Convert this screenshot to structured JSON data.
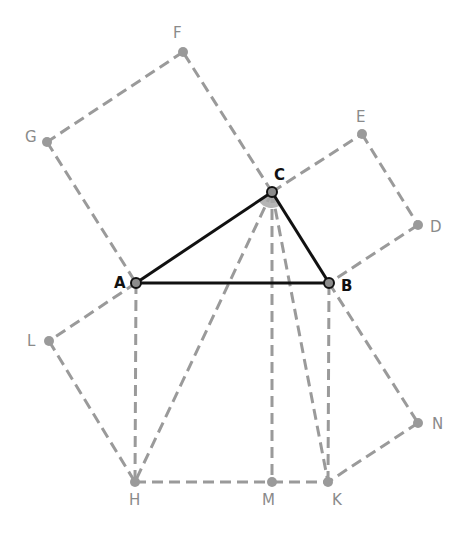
{
  "diagram": {
    "colors": {
      "main": "#111111",
      "construction": "#9a9a9a",
      "label_gray": "#8a8a8a",
      "background": "#ffffff"
    },
    "points": {
      "A": {
        "x": 136,
        "y": 283,
        "label": "A",
        "style": "main"
      },
      "B": {
        "x": 329,
        "y": 283,
        "label": "B",
        "style": "main"
      },
      "C": {
        "x": 272,
        "y": 192,
        "label": "C",
        "style": "main"
      },
      "D": {
        "x": 418,
        "y": 225,
        "label": "D",
        "style": "gray"
      },
      "E": {
        "x": 362,
        "y": 134,
        "label": "E",
        "style": "gray"
      },
      "F": {
        "x": 183,
        "y": 52,
        "label": "F",
        "style": "gray"
      },
      "G": {
        "x": 47,
        "y": 142,
        "label": "G",
        "style": "gray"
      },
      "H": {
        "x": 135,
        "y": 482,
        "label": "H",
        "style": "gray"
      },
      "K": {
        "x": 328,
        "y": 482,
        "label": "K",
        "style": "gray"
      },
      "L": {
        "x": 49,
        "y": 341,
        "label": "L",
        "style": "gray"
      },
      "M": {
        "x": 272,
        "y": 482,
        "label": "M",
        "style": "gray"
      },
      "N": {
        "x": 418,
        "y": 423,
        "label": "N",
        "style": "gray"
      }
    },
    "solid_segments": [
      [
        "A",
        "B"
      ],
      [
        "B",
        "C"
      ],
      [
        "C",
        "A"
      ]
    ],
    "dashed_segments": [
      [
        "C",
        "F"
      ],
      [
        "F",
        "G"
      ],
      [
        "G",
        "A"
      ],
      [
        "C",
        "E"
      ],
      [
        "E",
        "D"
      ],
      [
        "D",
        "B"
      ],
      [
        "A",
        "H"
      ],
      [
        "H",
        "M"
      ],
      [
        "M",
        "K"
      ],
      [
        "K",
        "B"
      ],
      [
        "A",
        "L"
      ],
      [
        "L",
        "H"
      ],
      [
        "B",
        "N"
      ],
      [
        "N",
        "K"
      ],
      [
        "C",
        "H"
      ],
      [
        "C",
        "M"
      ],
      [
        "C",
        "K"
      ]
    ],
    "right_angle_marker": {
      "at": "C",
      "label": "angle ACB"
    }
  }
}
